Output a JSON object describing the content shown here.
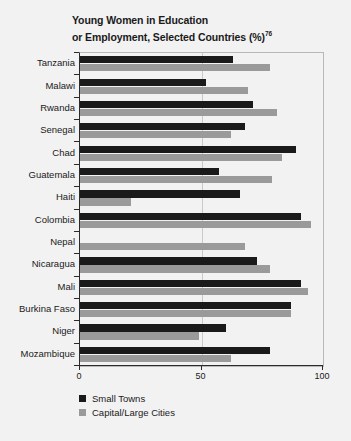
{
  "chart_data": {
    "type": "bar",
    "orientation": "horizontal",
    "title": "Young Women in Education or Employment, Selected Countries (%)",
    "title_line1": "Young Women in Education",
    "title_line2": "or Employment, Selected Countries (%)",
    "title_superscript": "76",
    "xlabel": "",
    "ylabel": "",
    "xlim": [
      0,
      100
    ],
    "xticks": [
      0,
      50,
      100
    ],
    "xticklabels": [
      "0",
      "50",
      "100"
    ],
    "grid": true,
    "gridlines_x": [
      50
    ],
    "legend_position": "below-left",
    "categories": [
      "Tanzania",
      "Malawi",
      "Rwanda",
      "Senegal",
      "Chad",
      "Guatemala",
      "Haiti",
      "Colombia",
      "Nepal",
      "Nicaragua",
      "Mali",
      "Burkina Faso",
      "Niger",
      "Mozambique"
    ],
    "series": [
      {
        "name": "Small Towns",
        "color": "#1a1a1a",
        "values": [
          63,
          52,
          71,
          68,
          89,
          57,
          66,
          91,
          0,
          73,
          91,
          87,
          60,
          78
        ]
      },
      {
        "name": "Capital/Large Cities",
        "color": "#9a9a9a",
        "values": [
          78,
          69,
          81,
          62,
          83,
          79,
          21,
          95,
          68,
          78,
          94,
          87,
          49,
          62
        ]
      }
    ]
  },
  "legend": {
    "items": [
      {
        "label": "Small Towns",
        "color": "#1a1a1a"
      },
      {
        "label": "Capital/Large Cities",
        "color": "#9a9a9a"
      }
    ]
  },
  "colors": {
    "background": "#f2f2f2",
    "series_dark": "#1a1a1a",
    "series_light": "#9a9a9a",
    "axis": "#2b2b2b",
    "gridline": "#c9c9c9",
    "plot_border": "#b8b8b8"
  }
}
